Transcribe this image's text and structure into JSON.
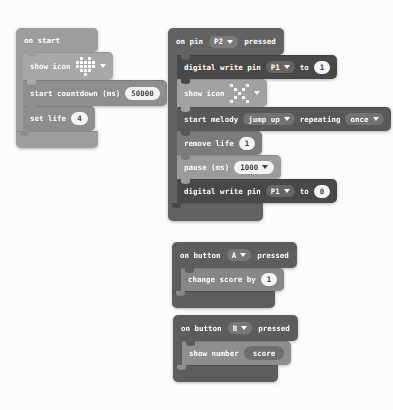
{
  "colors": {
    "page_bg": "#fcfcfc",
    "on_start_container": "#9d9d9d",
    "show_icon_block": "#a8a8a8",
    "countdown_block": "#8e8e8e",
    "set_life_block": "#8e8e8e",
    "on_pin_container": "#626262",
    "digital_write_block": "#484848",
    "show_icon_block_2": "#a1a1a1",
    "melody_block": "#585858",
    "remove_life_block": "#7b7b7b",
    "pause_block": "#9b9b9b",
    "button_container": "#5d5d5d",
    "change_score_block": "#878787",
    "show_number_block": "#8e8e8e",
    "score_pill": "#6f6f6f",
    "value_pill_bg": "#f4f4f4",
    "value_pill_text": "#3c3c3c"
  },
  "on_start": {
    "hat_label": "on start",
    "show_icon": {
      "label": "show icon",
      "icon": "heart-icon",
      "pattern": [
        "01010",
        "11111",
        "11111",
        "01110",
        "00100"
      ]
    },
    "countdown": {
      "label": "start countdown (ms)",
      "value": "50000"
    },
    "set_life": {
      "label": "set life",
      "value": "4"
    }
  },
  "on_pin": {
    "hat": {
      "on": "on pin",
      "pin": "P2",
      "pressed": "pressed"
    },
    "dw1": {
      "label": "digital write pin",
      "pin": "P1",
      "to": "to",
      "value": "1"
    },
    "show_icon": {
      "label": "show icon",
      "icon": "no-icon",
      "pattern": [
        "10001",
        "01010",
        "00100",
        "01010",
        "10001"
      ]
    },
    "melody": {
      "label": "start melody",
      "melody": "jump up",
      "repeating": "repeating",
      "mode": "once"
    },
    "remove_life": {
      "label": "remove life",
      "value": "1"
    },
    "pause": {
      "label": "pause (ms)",
      "value": "1000"
    },
    "dw2": {
      "label": "digital write pin",
      "pin": "P1",
      "to": "to",
      "value": "0"
    }
  },
  "on_button_a": {
    "hat": {
      "on": "on button",
      "button": "A",
      "pressed": "pressed"
    },
    "change_score": {
      "label": "change score by",
      "value": "1"
    }
  },
  "on_button_b": {
    "hat": {
      "on": "on button",
      "button": "B",
      "pressed": "pressed"
    },
    "show_number": {
      "label": "show number",
      "value": "score"
    }
  }
}
